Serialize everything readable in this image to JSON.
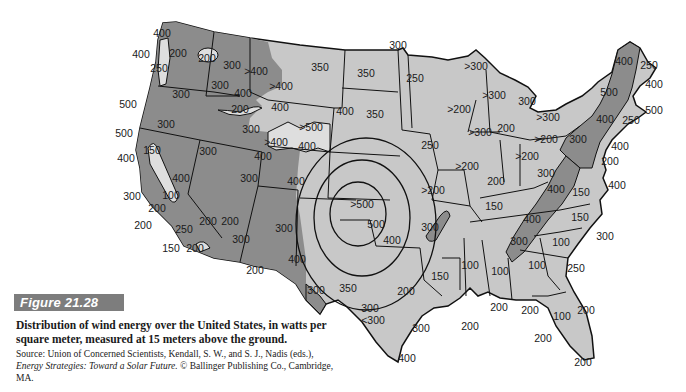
{
  "figure": {
    "label": "Figure 21.28",
    "caption": "Distribution of wind energy over the United States, in watts per square meter, measured at 15 meters above the ground.",
    "source_prefix": "Source: Union of Concerned Scientists, Kendall, S. W., and S. J., Nadis (eds.), ",
    "source_title": "Energy Strategies: Toward a Solar Future.",
    "source_suffix": " © Ballinger Publishing Co., Cambridge, MA."
  },
  "colors": {
    "high_wind_fill": "#8c8c8c",
    "low_wind_fill": "#c8c8c8",
    "lightest_fill": "#dedede",
    "border": "#111111",
    "figure_box": "#7d7d7d"
  },
  "map": {
    "units": "watts per square meter",
    "height": "15 meters above the ground",
    "labels": [
      {
        "id": "wa-coast-n",
        "text": "400",
        "x": 152,
        "y": 37
      },
      {
        "id": "wa-coast",
        "text": "400",
        "x": 133,
        "y": 58
      },
      {
        "id": "wa-puget",
        "text": "200",
        "x": 172,
        "y": 57
      },
      {
        "id": "wa-east",
        "text": "200",
        "x": 197,
        "y": 62
      },
      {
        "id": "wa-sw",
        "text": "250",
        "x": 150,
        "y": 72
      },
      {
        "id": "id-n",
        "text": "300",
        "x": 223,
        "y": 70
      },
      {
        "id": "mt-w",
        "text": ">400",
        "x": 250,
        "y": 75
      },
      {
        "id": "mt-c",
        "text": ">400",
        "x": 271,
        "y": 90
      },
      {
        "id": "id-c",
        "text": "300",
        "x": 220,
        "y": 89
      },
      {
        "id": "id-s",
        "text": "400",
        "x": 236,
        "y": 97
      },
      {
        "id": "id-snake",
        "text": "200",
        "x": 240,
        "y": 113
      },
      {
        "id": "or",
        "text": "300",
        "x": 178,
        "y": 98
      },
      {
        "id": "or-coast",
        "text": "500",
        "x": 120,
        "y": 108
      },
      {
        "id": "ca-coast-n",
        "text": "500",
        "x": 114,
        "y": 137
      },
      {
        "id": "ca-n",
        "text": "300",
        "x": 160,
        "y": 128
      },
      {
        "id": "nv",
        "text": "300",
        "x": 207,
        "y": 155
      },
      {
        "id": "ut-n",
        "text": "300",
        "x": 252,
        "y": 133
      },
      {
        "id": "wy-w",
        "text": "400",
        "x": 281,
        "y": 111
      },
      {
        "id": "wy-c",
        "text": ">500",
        "x": 310,
        "y": 131
      },
      {
        "id": "wy-s",
        "text": ">400",
        "x": 274,
        "y": 146
      },
      {
        "id": "wy-se",
        "text": "400",
        "x": 307,
        "y": 149
      },
      {
        "id": "ut-s",
        "text": "400",
        "x": 262,
        "y": 160
      },
      {
        "id": "ca-c",
        "text": "150",
        "x": 152,
        "y": 154
      },
      {
        "id": "ca-coast",
        "text": "400",
        "x": 124,
        "y": 162
      },
      {
        "id": "ca-sierra",
        "text": "400",
        "x": 180,
        "y": 177
      },
      {
        "id": "co",
        "text": "400",
        "x": 296,
        "y": 185
      },
      {
        "id": "ut-se",
        "text": "300",
        "x": 255,
        "y": 180
      },
      {
        "id": "ca-coast-c",
        "text": "300",
        "x": 132,
        "y": 198
      },
      {
        "id": "ca-valley",
        "text": "100",
        "x": 171,
        "y": 196
      },
      {
        "id": "ca-sc",
        "text": "200",
        "x": 156,
        "y": 210
      },
      {
        "id": "ca-coast-s",
        "text": "200",
        "x": 143,
        "y": 226
      },
      {
        "id": "ca-s",
        "text": "250",
        "x": 183,
        "y": 230
      },
      {
        "id": "nv-s",
        "text": "200",
        "x": 208,
        "y": 222
      },
      {
        "id": "az-w",
        "text": "200",
        "x": 224,
        "y": 224
      },
      {
        "id": "ca-coast-sw",
        "text": "150",
        "x": 171,
        "y": 249
      },
      {
        "id": "ca-se",
        "text": "200",
        "x": 195,
        "y": 249
      },
      {
        "id": "az",
        "text": "300",
        "x": 238,
        "y": 240
      },
      {
        "id": "nm",
        "text": "300",
        "x": 283,
        "y": 229
      },
      {
        "id": "az-s",
        "text": "200",
        "x": 254,
        "y": 270
      },
      {
        "id": "nm-s",
        "text": "400",
        "x": 297,
        "y": 260
      },
      {
        "id": "tx-w",
        "text": "300",
        "x": 316,
        "y": 293
      },
      {
        "id": "mt-e",
        "text": "350",
        "x": 318,
        "y": 71
      },
      {
        "id": "nd",
        "text": "350",
        "x": 366,
        "y": 76
      },
      {
        "id": "mn-nw",
        "text": "300",
        "x": 398,
        "y": 49
      },
      {
        "id": "mn",
        "text": "250",
        "x": 415,
        "y": 81
      },
      {
        "id": "sd-w",
        "text": "400",
        "x": 343,
        "y": 114
      },
      {
        "id": "sd",
        "text": "350",
        "x": 375,
        "y": 117
      },
      {
        "id": "ne-e",
        "text": "250",
        "x": 430,
        "y": 148
      },
      {
        "id": "ks",
        "text": ">500",
        "x": 362,
        "y": 207
      },
      {
        "id": "ok",
        "text": "500",
        "x": 376,
        "y": 227
      },
      {
        "id": "ok-s",
        "text": "400",
        "x": 392,
        "y": 243
      },
      {
        "id": "mo",
        "text": ">200",
        "x": 433,
        "y": 193
      },
      {
        "id": "ar",
        "text": "300",
        "x": 430,
        "y": 230
      },
      {
        "id": "tx-nw",
        "text": "350",
        "x": 348,
        "y": 292
      },
      {
        "id": "tx-c",
        "text": "300",
        "x": 369,
        "y": 311
      },
      {
        "id": "tx-c2",
        "text": "<300",
        "x": 374,
        "y": 323
      },
      {
        "id": "tx-e",
        "text": "200",
        "x": 405,
        "y": 294
      },
      {
        "id": "tx-coast",
        "text": "300",
        "x": 420,
        "y": 331
      },
      {
        "id": "tx-s",
        "text": "400",
        "x": 407,
        "y": 361
      },
      {
        "id": "la-n",
        "text": "150",
        "x": 440,
        "y": 277
      },
      {
        "id": "la-coast",
        "text": "200",
        "x": 470,
        "y": 328
      },
      {
        "id": "ms",
        "text": "100",
        "x": 470,
        "y": 267
      },
      {
        "id": "al",
        "text": "100",
        "x": 500,
        "y": 274
      },
      {
        "id": "ga",
        "text": "100",
        "x": 537,
        "y": 266
      },
      {
        "id": "fl-pan",
        "text": "200",
        "x": 499,
        "y": 309
      },
      {
        "id": "fl-pan2",
        "text": "200",
        "x": 530,
        "y": 313
      },
      {
        "id": "fl",
        "text": "100",
        "x": 560,
        "y": 318
      },
      {
        "id": "fl-e",
        "text": "200",
        "x": 586,
        "y": 313
      },
      {
        "id": "fl-w",
        "text": "200",
        "x": 541,
        "y": 340
      },
      {
        "id": "fl-s",
        "text": "200",
        "x": 583,
        "y": 364
      },
      {
        "id": "sc",
        "text": "100",
        "x": 561,
        "y": 244
      },
      {
        "id": "ga-coast",
        "text": "250",
        "x": 576,
        "y": 270
      },
      {
        "id": "nc-coast",
        "text": "300",
        "x": 605,
        "y": 237
      },
      {
        "id": "nc",
        "text": "150",
        "x": 580,
        "y": 218
      },
      {
        "id": "va",
        "text": "150",
        "x": 580,
        "y": 193
      },
      {
        "id": "tn",
        "text": "150",
        "x": 493,
        "y": 209
      },
      {
        "id": "tn-app",
        "text": "400",
        "x": 532,
        "y": 221
      },
      {
        "id": "ga-app",
        "text": "300",
        "x": 519,
        "y": 243
      },
      {
        "id": "wv",
        "text": "300",
        "x": 545,
        "y": 175
      },
      {
        "id": "wv-app",
        "text": "400",
        "x": 556,
        "y": 191
      },
      {
        "id": "ky",
        "text": "200",
        "x": 495,
        "y": 183
      },
      {
        "id": "il",
        "text": ">200",
        "x": 466,
        "y": 168
      },
      {
        "id": "in",
        "text": ">200",
        "x": 525,
        "y": 158
      },
      {
        "id": "oh-n",
        "text": ">200",
        "x": 541,
        "y": 141
      },
      {
        "id": "pa-w",
        "text": ">300",
        "x": 547,
        "y": 120
      },
      {
        "id": "mi-upper",
        "text": ">300",
        "x": 475,
        "y": 68
      },
      {
        "id": "wi",
        "text": ">200",
        "x": 458,
        "y": 112
      },
      {
        "id": "mi-n",
        "text": ">300",
        "x": 492,
        "y": 97
      },
      {
        "id": "mi-e",
        "text": "300",
        "x": 527,
        "y": 103
      },
      {
        "id": "mi-s",
        "text": "200",
        "x": 506,
        "y": 129
      },
      {
        "id": "mi-sw",
        "text": ">300",
        "x": 480,
        "y": 134
      },
      {
        "id": "pa",
        "text": "300",
        "x": 578,
        "y": 141
      },
      {
        "id": "me-n",
        "text": "400",
        "x": 624,
        "y": 62
      },
      {
        "id": "me",
        "text": "250",
        "x": 648,
        "y": 67
      },
      {
        "id": "me-coast",
        "text": "400",
        "x": 653,
        "y": 85
      },
      {
        "id": "vt-nh",
        "text": "500",
        "x": 610,
        "y": 93
      },
      {
        "id": "ma-coast",
        "text": "500",
        "x": 654,
        "y": 112
      },
      {
        "id": "ny",
        "text": "400",
        "x": 605,
        "y": 120
      },
      {
        "id": "ma",
        "text": "250",
        "x": 630,
        "y": 121
      },
      {
        "id": "nj-coast",
        "text": "400",
        "x": 619,
        "y": 147
      },
      {
        "id": "de-md",
        "text": "200",
        "x": 609,
        "y": 162
      },
      {
        "id": "va-coast",
        "text": "400",
        "x": 615,
        "y": 185
      }
    ]
  }
}
